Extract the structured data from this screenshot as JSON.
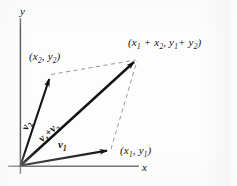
{
  "figure": {
    "caption_type": "vector-addition-parallelogram",
    "colors": {
      "ink": "#121212",
      "axis": "#4a4a4a",
      "dashed": "#8a8a8a",
      "background": "#fdfdfd"
    },
    "axes": {
      "x_label": "x",
      "y_label": "y"
    },
    "points": [
      {
        "id": "v2-tip",
        "label_html": "(x<sub>2</sub>, y<sub>2</sub>)"
      },
      {
        "id": "v1-tip",
        "label_html": "(x<sub>1</sub>, y<sub>1</sub>)"
      },
      {
        "id": "resultant-tip",
        "label_html": "(x<sub>1</sub> + x<sub>2</sub>,  y<sub>1</sub>+ y<sub>2</sub>)"
      }
    ],
    "vectors": [
      {
        "id": "v1",
        "label_html": "v<sub>1</sub>"
      },
      {
        "id": "v2",
        "label_html": "v<sub>2</sub>"
      },
      {
        "id": "resultant",
        "label_html": "v<sub>1</sub><span class=\"op\">+</span>v<sub>2</sub>"
      }
    ]
  },
  "chart_data": {
    "type": "diagram",
    "title": "",
    "xlabel": "x",
    "ylabel": "y",
    "origin": [
      20,
      166
    ],
    "vectors": [
      {
        "name": "v1",
        "from": [
          20,
          166
        ],
        "to": [
          110,
          150
        ],
        "style": "solid-arrow"
      },
      {
        "name": "v2",
        "from": [
          20,
          166
        ],
        "to": [
          50,
          74
        ],
        "style": "solid-arrow"
      },
      {
        "name": "v1 + v2",
        "from": [
          20,
          166
        ],
        "to": [
          137,
          59
        ],
        "style": "solid-arrow"
      }
    ],
    "dashed_edges": [
      {
        "from": [
          50,
          74
        ],
        "to": [
          137,
          59
        ]
      },
      {
        "from": [
          110,
          150
        ],
        "to": [
          137,
          59
        ]
      }
    ],
    "labels": [
      {
        "text": "(x2, y2)",
        "at": [
          30,
          58
        ]
      },
      {
        "text": "(x1, y1)",
        "at": [
          122,
          152
        ]
      },
      {
        "text": "(x1 + x2, y1 + y2)",
        "at": [
          130,
          45
        ]
      },
      {
        "text": "v1",
        "at": [
          62,
          144
        ]
      },
      {
        "text": "v2",
        "at": [
          28,
          118
        ]
      },
      {
        "text": "v1 + v2",
        "at": [
          44,
          130
        ]
      },
      {
        "text": "x",
        "at": [
          144,
          169
        ]
      },
      {
        "text": "y",
        "at": [
          22,
          13
        ]
      }
    ]
  }
}
